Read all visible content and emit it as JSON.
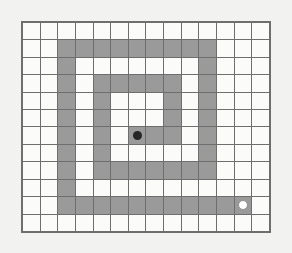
{
  "figure": {
    "title": "",
    "type": "grid-maze",
    "background_color": "#f2f2f0"
  },
  "grid": {
    "columns": 14,
    "rows": 12,
    "cell_open_color": "#fbfbfa",
    "cell_wall_color": "#9a9a9a",
    "line_color": "#6e6e6e",
    "line_width_px": 1,
    "legend": {
      "open": 0,
      "wall": 1
    },
    "cells": [
      [
        0,
        0,
        0,
        0,
        0,
        0,
        0,
        0,
        0,
        0,
        0,
        0,
        0,
        0
      ],
      [
        0,
        0,
        1,
        1,
        1,
        1,
        1,
        1,
        1,
        1,
        1,
        0,
        0,
        0
      ],
      [
        0,
        0,
        1,
        0,
        0,
        0,
        0,
        0,
        0,
        0,
        1,
        0,
        0,
        0
      ],
      [
        0,
        0,
        1,
        0,
        1,
        1,
        1,
        1,
        1,
        0,
        1,
        0,
        0,
        0
      ],
      [
        0,
        0,
        1,
        0,
        1,
        0,
        0,
        0,
        1,
        0,
        1,
        0,
        0,
        0
      ],
      [
        0,
        0,
        1,
        0,
        1,
        0,
        0,
        0,
        1,
        0,
        1,
        0,
        0,
        0
      ],
      [
        0,
        0,
        1,
        0,
        1,
        0,
        1,
        1,
        1,
        0,
        1,
        0,
        0,
        0
      ],
      [
        0,
        0,
        1,
        0,
        1,
        0,
        0,
        0,
        0,
        0,
        1,
        0,
        0,
        0
      ],
      [
        0,
        0,
        1,
        0,
        1,
        1,
        1,
        1,
        1,
        1,
        1,
        0,
        0,
        0
      ],
      [
        0,
        0,
        1,
        0,
        0,
        0,
        0,
        0,
        0,
        0,
        0,
        0,
        0,
        0
      ],
      [
        0,
        0,
        1,
        1,
        1,
        1,
        1,
        1,
        1,
        1,
        1,
        1,
        1,
        0
      ],
      [
        0,
        0,
        0,
        0,
        0,
        0,
        0,
        0,
        0,
        0,
        0,
        0,
        0,
        0
      ]
    ]
  },
  "markers": {
    "start": {
      "name": "start-marker",
      "column": 6,
      "row": 6,
      "color": "#262626",
      "shape": "filled-circle"
    },
    "goal": {
      "name": "goal-marker",
      "column": 12,
      "row": 10,
      "color": "#ffffff",
      "outline_color": "#8f8f8f",
      "shape": "outlined-circle"
    }
  }
}
